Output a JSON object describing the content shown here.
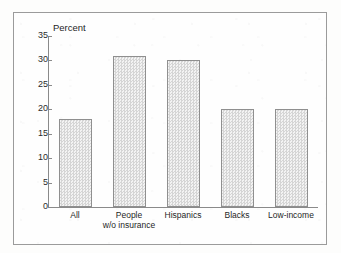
{
  "figure": {
    "frame_color": "#9b9b9b",
    "background": "#fefefe"
  },
  "chart_data": {
    "type": "bar",
    "title": "",
    "subtitle": "",
    "xlabel": "",
    "ylabel": "Percent",
    "ylim": [
      0,
      35
    ],
    "ytick_values": [
      0,
      5,
      10,
      15,
      20,
      25,
      30,
      35
    ],
    "ytick_labels": [
      "0",
      "5",
      "10",
      "15",
      "20",
      "25",
      "30",
      "35"
    ],
    "grid": false,
    "legend": null,
    "legend_position": "none",
    "categories": [
      "All",
      "People w/o insurance",
      "Hispanics",
      "Blacks",
      "Low-income"
    ],
    "category_label_lines": [
      [
        "All"
      ],
      [
        "People",
        "w/o insurance"
      ],
      [
        "Hispanics"
      ],
      [
        "Blacks"
      ],
      [
        "Low-income"
      ]
    ],
    "values": [
      18,
      31,
      30,
      20,
      20
    ],
    "series": [
      {
        "name": "Percent",
        "values": [
          18,
          31,
          30,
          20,
          20
        ]
      }
    ],
    "bar_fill_color": "#e4e4e4",
    "bar_edge_color": "#8f8f8f",
    "axis_color": "#8a8a8a"
  }
}
